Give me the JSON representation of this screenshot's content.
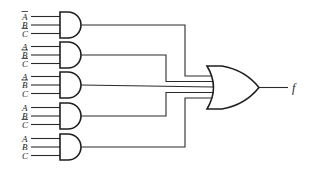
{
  "diagram": {
    "type": "logic-circuit",
    "output_label": "f",
    "and_gates": [
      {
        "id": "and1",
        "inputs": [
          {
            "var": "A",
            "neg": true
          },
          {
            "var": "B",
            "neg": false
          },
          {
            "var": "C",
            "neg": true
          }
        ]
      },
      {
        "id": "and2",
        "inputs": [
          {
            "var": "A",
            "neg": false
          },
          {
            "var": "B",
            "neg": true
          },
          {
            "var": "C",
            "neg": true
          }
        ]
      },
      {
        "id": "and3",
        "inputs": [
          {
            "var": "A",
            "neg": false
          },
          {
            "var": "B",
            "neg": true
          },
          {
            "var": "C",
            "neg": false
          }
        ]
      },
      {
        "id": "and4",
        "inputs": [
          {
            "var": "A",
            "neg": false
          },
          {
            "var": "B",
            "neg": false
          },
          {
            "var": "C",
            "neg": true
          }
        ]
      },
      {
        "id": "and5",
        "inputs": [
          {
            "var": "A",
            "neg": false
          },
          {
            "var": "B",
            "neg": false
          },
          {
            "var": "C",
            "neg": false
          }
        ]
      }
    ],
    "or_gate": {
      "id": "or1",
      "input_count": 5
    }
  }
}
